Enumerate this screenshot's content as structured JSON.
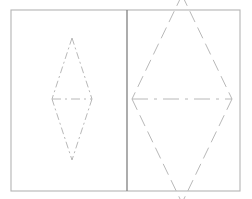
{
  "figure": {
    "canvas": {
      "width": 252,
      "height": 199,
      "background": "#ffffff"
    },
    "styles": {
      "frame_color": "#b4b4b4",
      "frame_width": 1.1,
      "divider_color": "#808080",
      "divider_width": 1.3,
      "line_color": "#b0b0b0",
      "line_width": 0.9,
      "dash_dot_pattern": "7 3 2 3",
      "dash_pattern": "9 5",
      "long_dash_pattern": "12 6"
    },
    "frame": {
      "name": "outer-frame",
      "x": 11,
      "y": 10,
      "width": 229,
      "height": 181
    },
    "divider": {
      "name": "vertical-divider",
      "x": 127,
      "y1": 10,
      "y2": 191
    },
    "panels": [
      {
        "id": "left-panel",
        "label": "left panel",
        "shape": {
          "name": "narrow-rhombus",
          "type": "rhombus",
          "center_x": 72,
          "center_y": 99,
          "half_width": 20,
          "half_height": 61,
          "top_vertex": [
            72,
            38
          ],
          "bottom_vertex": [
            72,
            160
          ],
          "left_vertex": [
            52,
            99
          ],
          "right_vertex": [
            92,
            99
          ],
          "horizontal_axis": {
            "x1": 52,
            "y1": 99,
            "x2": 92,
            "y2": 99
          }
        }
      },
      {
        "id": "right-panel",
        "label": "right panel",
        "shape": {
          "name": "wide-rhombus",
          "type": "rhombus",
          "center_x": 182,
          "center_y": 99,
          "half_width": 50,
          "half_height": 104,
          "top_vertex": [
            182,
            -5
          ],
          "bottom_vertex": [
            182,
            203
          ],
          "left_vertex": [
            132,
            99
          ],
          "right_vertex": [
            232,
            99
          ],
          "horizontal_axis": {
            "x1": 132,
            "y1": 99,
            "x2": 232,
            "y2": 99
          }
        }
      }
    ]
  }
}
